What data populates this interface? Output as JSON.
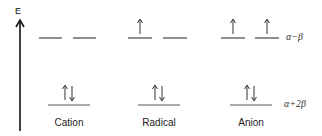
{
  "axis": {
    "label": "E",
    "direction": "up"
  },
  "levels": {
    "upper": {
      "label": "α−β"
    },
    "lower": {
      "label": "α+2β"
    }
  },
  "species": [
    {
      "name": "Cation",
      "lower_electrons": "↑↓",
      "upper_left_electrons": "",
      "upper_right_electrons": ""
    },
    {
      "name": "Radical",
      "lower_electrons": "↑↓",
      "upper_left_electrons": "↑",
      "upper_right_electrons": ""
    },
    {
      "name": "Anion",
      "lower_electrons": "↑↓",
      "upper_left_electrons": "↑",
      "upper_right_electrons": "↑"
    }
  ],
  "colors": {
    "line": "#444444",
    "text": "#222222"
  }
}
